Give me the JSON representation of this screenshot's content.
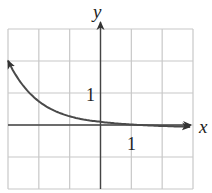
{
  "chart_data": {
    "type": "line",
    "title": "",
    "xlabel": "x",
    "ylabel": "y",
    "xlim": [
      -3,
      3
    ],
    "ylim": [
      -2,
      3
    ],
    "grid": true,
    "grid_step": 1,
    "tick_labels": {
      "x": [
        "1"
      ],
      "y": [
        "1"
      ]
    },
    "series": [
      {
        "name": "curve",
        "description": "decreasing exponential-type curve, y ≈ 0.1·e^(-x), asymptotic to x-axis from slightly below on the right",
        "x": [
          -3,
          -2.5,
          -2,
          -1.5,
          -1,
          -0.5,
          0,
          0.5,
          1,
          1.5,
          2,
          2.5,
          2.9
        ],
        "y": [
          2.2,
          1.55,
          1.1,
          0.75,
          0.45,
          0.25,
          0.1,
          0.04,
          0.0,
          -0.02,
          -0.03,
          -0.05,
          -0.06
        ]
      }
    ],
    "annotations": [
      {
        "text": "1",
        "position": "left of y-axis at y=1"
      },
      {
        "text": "1",
        "position": "below x-axis at x=1"
      }
    ]
  },
  "labels": {
    "x_axis": "x",
    "y_axis": "y",
    "x_tick": "1",
    "y_tick": "1"
  },
  "colors": {
    "grid": "#c8c8c8",
    "axis": "#444444",
    "curve": "#4a4a4a",
    "text": "#222222"
  }
}
